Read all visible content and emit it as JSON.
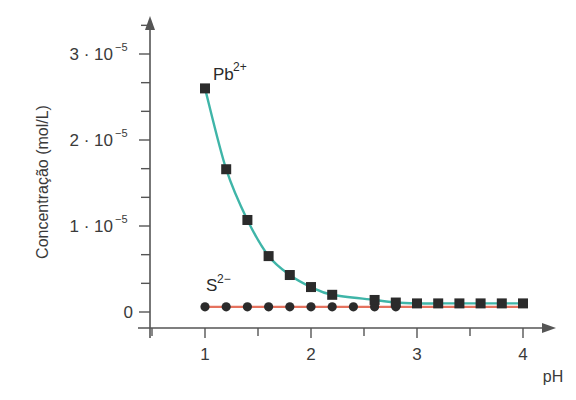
{
  "chart_data": {
    "type": "line",
    "title": "",
    "xlabel": "pH",
    "ylabel": "Concentração (mol/L)",
    "xlim": [
      0.6,
      4.3
    ],
    "ylim": [
      0,
      3.2e-05
    ],
    "x_ticks": [
      1,
      2,
      3,
      4
    ],
    "x_minor_ticks": [
      0.5,
      1.5,
      2.5,
      3.5
    ],
    "y_ticks": [
      {
        "value": 0,
        "label": "0"
      },
      {
        "value": 1e-05,
        "label": "1 · 10",
        "exp": "−5"
      },
      {
        "value": 2e-05,
        "label": "2 · 10",
        "exp": "−5"
      },
      {
        "value": 3e-05,
        "label": "3 · 10",
        "exp": "−5"
      }
    ],
    "grid": false,
    "legend": "inline labels",
    "series": [
      {
        "name": "Pb2+",
        "label_main": "Pb",
        "label_sup": "2+",
        "marker": "square",
        "line_color": "#3fb5a8",
        "x": [
          1.0,
          1.2,
          1.4,
          1.6,
          1.8,
          2.0,
          2.2,
          2.6,
          2.8,
          3.0,
          3.2,
          3.4,
          3.6,
          3.8,
          4.0
        ],
        "values": [
          2.6e-05,
          1.66e-05,
          1.07e-05,
          6.5e-06,
          4.3e-06,
          2.9e-06,
          2e-06,
          1.4e-06,
          1.1e-06,
          1e-06,
          1e-06,
          1e-06,
          1e-06,
          1e-06,
          1e-06
        ]
      },
      {
        "name": "S2-",
        "label_main": "S",
        "label_sup": "2−",
        "marker": "circle",
        "line_color": "#e5725e",
        "x": [
          1.0,
          1.2,
          1.4,
          1.6,
          1.8,
          2.0,
          2.2,
          2.4,
          2.6,
          2.8
        ],
        "values": [
          6e-07,
          6e-07,
          6e-07,
          6e-07,
          6e-07,
          6e-07,
          6e-07,
          6e-07,
          6e-07,
          6e-07
        ]
      }
    ]
  }
}
